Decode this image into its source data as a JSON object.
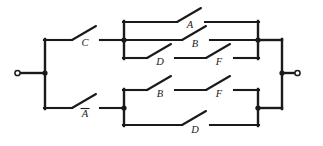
{
  "figure": {
    "name": "switching-circuit-diagram",
    "type": "relay-contact-network",
    "line_color": "#1a1a1a",
    "background_color": "#ffffff"
  },
  "terminals": {
    "input": {
      "label": "",
      "x": 18,
      "y": 73,
      "shape": "open-circle"
    },
    "output": {
      "label": "",
      "x": 297,
      "y": 73,
      "shape": "open-circle"
    }
  },
  "switches": {
    "c": {
      "label": "C",
      "overbar": false,
      "x": 85,
      "y": 46
    },
    "a_not": {
      "label": "A",
      "overbar": true,
      "x": 85,
      "y": 117
    },
    "a": {
      "label": "A",
      "overbar": false,
      "x": 190,
      "y": 28
    },
    "b_top": {
      "label": "B",
      "overbar": false,
      "x": 195,
      "y": 47
    },
    "d_top": {
      "label": "D",
      "overbar": false,
      "x": 160,
      "y": 64
    },
    "f_top": {
      "label": "F",
      "overbar": false,
      "x": 219,
      "y": 64
    },
    "b_bottom": {
      "label": "B",
      "overbar": false,
      "x": 160,
      "y": 96
    },
    "f_bottom": {
      "label": "F",
      "overbar": false,
      "x": 219,
      "y": 96
    },
    "d_bottom": {
      "label": "D",
      "overbar": false,
      "x": 195,
      "y": 133
    }
  },
  "groups": {
    "top": {
      "name": "upper-parallel-bank",
      "rails": [
        {
          "name": "rail-a",
          "y": 22,
          "contacts": [
            "A"
          ]
        },
        {
          "name": "rail-b",
          "y": 40,
          "contacts": [
            "B"
          ]
        },
        {
          "name": "rail-df",
          "y": 58,
          "contacts": [
            "D",
            "F"
          ]
        }
      ]
    },
    "bottom": {
      "name": "lower-parallel-bank",
      "rails": [
        {
          "name": "rail-bf",
          "y": 90,
          "contacts": [
            "B",
            "F"
          ]
        },
        {
          "name": "rail-d",
          "y": 125,
          "contacts": [
            "D"
          ]
        }
      ]
    }
  },
  "nodes": {
    "input_junction": {
      "x": 45,
      "y": 73
    },
    "top_left_junction": {
      "x": 124,
      "y": 40
    },
    "bottom_left_junction": {
      "x": 124,
      "y": 108
    },
    "top_right_junction": {
      "x": 258,
      "y": 40
    },
    "bottom_right_junction": {
      "x": 258,
      "y": 108
    },
    "output_junction": {
      "x": 282,
      "y": 73
    }
  }
}
